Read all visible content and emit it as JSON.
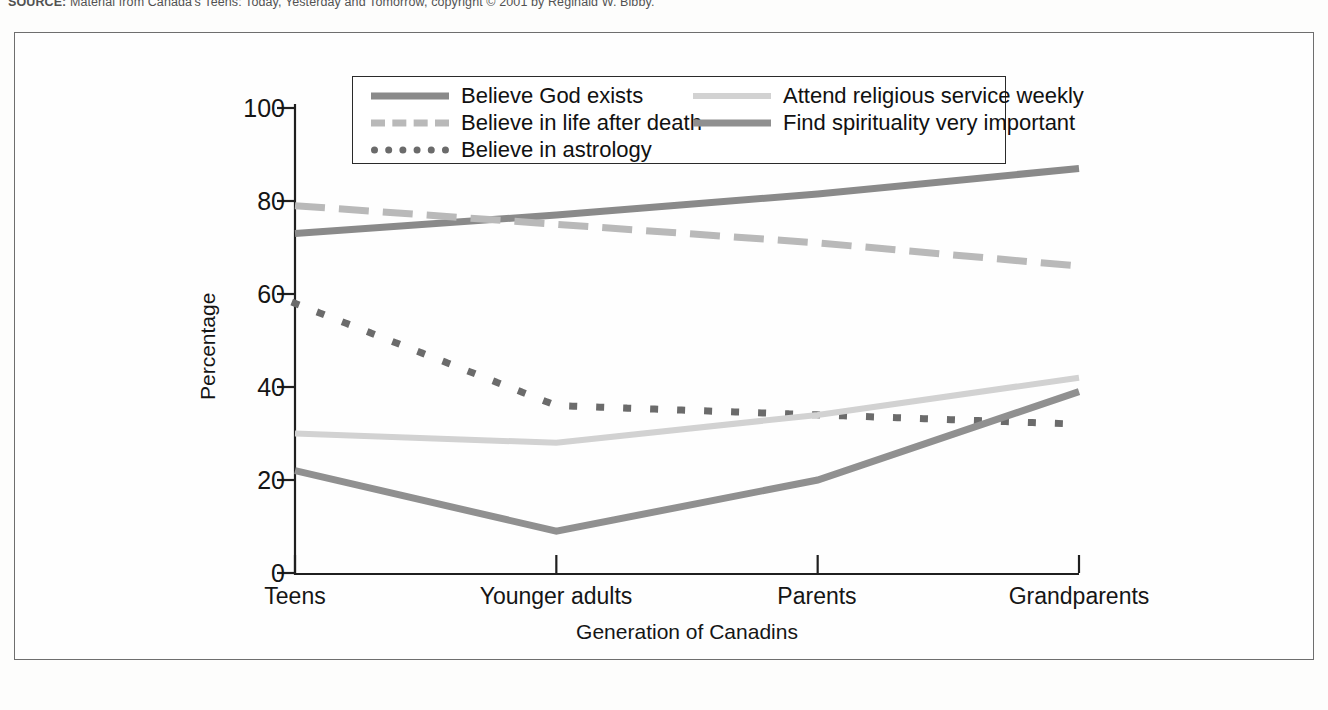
{
  "source_note": {
    "prefix": "SOURCE:",
    "text": "Material from Canada's Teens: Today, Yesterday and Tomorrow, copyright © 2001 by Reginald W. Bibby."
  },
  "chart_data": {
    "type": "line",
    "title": "",
    "xlabel": "Generation of Canadins",
    "ylabel": "Percentage",
    "categories": [
      "Teens",
      "Younger adults",
      "Parents",
      "Grandparents"
    ],
    "ylim": [
      0,
      100
    ],
    "yticks": [
      0,
      20,
      40,
      60,
      80,
      100
    ],
    "grid": false,
    "legend_position": "top-center-inside",
    "series": [
      {
        "name": "Believe God exists",
        "values": [
          73,
          77,
          81.5,
          87
        ],
        "color": "#8a8a8a",
        "style": "solid",
        "width": 7
      },
      {
        "name": "Believe in life after death",
        "values": [
          79,
          75,
          71,
          66
        ],
        "color": "#b9b9b9",
        "style": "dashed",
        "width": 7
      },
      {
        "name": "Believe in astrology",
        "values": [
          58,
          36,
          34,
          32
        ],
        "color": "#6b6b6b",
        "style": "dotted",
        "width": 7
      },
      {
        "name": "Attend religious service weekly",
        "values": [
          30,
          28,
          34,
          42
        ],
        "color": "#d2d2d2",
        "style": "solid",
        "width": 6
      },
      {
        "name": "Find spirituality very important",
        "values": [
          22,
          9,
          20,
          39
        ],
        "color": "#909090",
        "style": "solid",
        "width": 7
      }
    ]
  },
  "legend": {
    "entries": [
      {
        "label": "Believe God exists"
      },
      {
        "label": "Believe in life after death"
      },
      {
        "label": "Believe in astrology"
      },
      {
        "label": "Attend religious service weekly"
      },
      {
        "label": "Find spirituality very important"
      }
    ]
  },
  "axes": {
    "y_tick_labels": [
      "100",
      "80",
      "60",
      "40",
      "20",
      "0"
    ],
    "x_tick_labels": [
      "Teens",
      "Younger adults",
      "Parents",
      "Grandparents"
    ],
    "y_title": "Percentage",
    "x_title": "Generation of Canadins"
  },
  "colors": {
    "frame": "#6e6e6e",
    "axis": "#1f1f1f",
    "text": "#151515",
    "background": "#fefefe"
  }
}
